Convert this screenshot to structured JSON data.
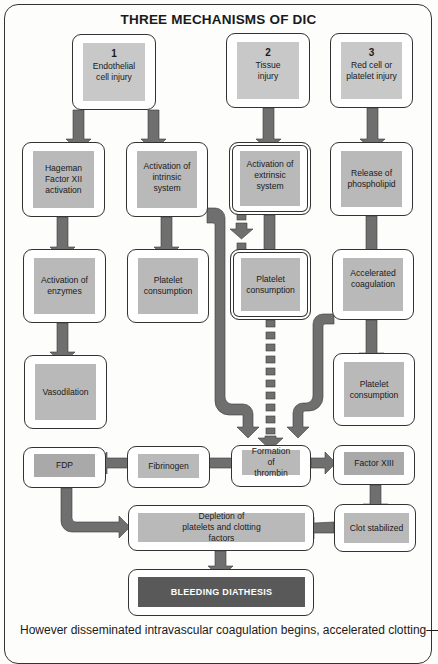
{
  "title": "THREE MECHANISMS OF DIC",
  "mechanisms": [
    {
      "number": "1",
      "label": "Endothelial cell injury"
    },
    {
      "number": "2",
      "label": "Tissue injury"
    },
    {
      "number": "3",
      "label": "Red cell or platelet injury"
    }
  ],
  "column1": [
    "Hageman Factor XII activation",
    "Activation of enzymes",
    "Vasodilation"
  ],
  "column2": [
    "Activation of intrinsic system",
    "Platelet consumption"
  ],
  "column3": [
    "Activation of extrinsic system",
    "Platelet consumption"
  ],
  "column4": [
    "Release of phospholipid",
    "Accelerated coagulation",
    "Platelet consumption"
  ],
  "bottom": {
    "fdp": "FDP",
    "fibrinogen": "Fibrinogen",
    "thrombin": "Formation of thrombin",
    "factor13": "Factor XIII",
    "clot": "Clot stabilized",
    "depletion": "Depletion of platelets and clotting factors",
    "bleeding": "BLEEDING DIATHESIS"
  },
  "caption": "However disseminated intravascular coagulation begins, accelerated clotting—",
  "colors": {
    "arrow_fill": "#6f6f6f",
    "box_fill_light": "#c8c8c8",
    "box_fill": "#b9b9b9",
    "box_fill_dark": "#595959"
  }
}
